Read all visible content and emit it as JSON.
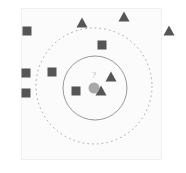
{
  "figure": {
    "title": "",
    "background_color": "#ffffff",
    "panel_color": "#fbfbfb",
    "panel_border_color": "#f0f0f0"
  },
  "labels": {
    "query_marker": "?"
  },
  "chart_data": {
    "type": "scatter",
    "title": "",
    "subtitle": "",
    "xlabel": "",
    "ylabel": "",
    "xlim": [
      0,
      186
    ],
    "ylim": [
      0,
      173
    ],
    "grid": false,
    "legend": null,
    "axis_ticks": [],
    "series": [
      {
        "name": "square-class",
        "marker": "square",
        "color": "#555555",
        "size": 9,
        "points": [
          {
            "x": 27,
            "y": 31
          },
          {
            "x": 26,
            "y": 73
          },
          {
            "x": 26,
            "y": 93
          },
          {
            "x": 52,
            "y": 72
          },
          {
            "x": 102,
            "y": 45
          },
          {
            "x": 76,
            "y": 91
          }
        ]
      },
      {
        "name": "triangle-class",
        "marker": "triangle",
        "color": "#555555",
        "size": 11,
        "points": [
          {
            "x": 82,
            "y": 23
          },
          {
            "x": 124,
            "y": 17
          },
          {
            "x": 169,
            "y": 31
          },
          {
            "x": 111,
            "y": 77
          },
          {
            "x": 101,
            "y": 91
          }
        ]
      },
      {
        "name": "query-point",
        "marker": "circle",
        "color": "#a8a8a8",
        "size": 11,
        "points": [
          {
            "x": 94,
            "y": 88,
            "label": "?"
          }
        ]
      }
    ],
    "circles": [
      {
        "name": "inner-neighbourhood",
        "cx": 95,
        "cy": 88,
        "r": 32,
        "style": "solid",
        "stroke": "#8c8c8c",
        "stroke_width": 0.9,
        "fill": "none"
      },
      {
        "name": "outer-neighbourhood",
        "cx": 94,
        "cy": 86,
        "r": 58,
        "style": "dashed",
        "stroke": "#9a9a9a",
        "stroke_width": 0.9,
        "fill": "none",
        "dash": "1.6 3.2"
      }
    ]
  }
}
